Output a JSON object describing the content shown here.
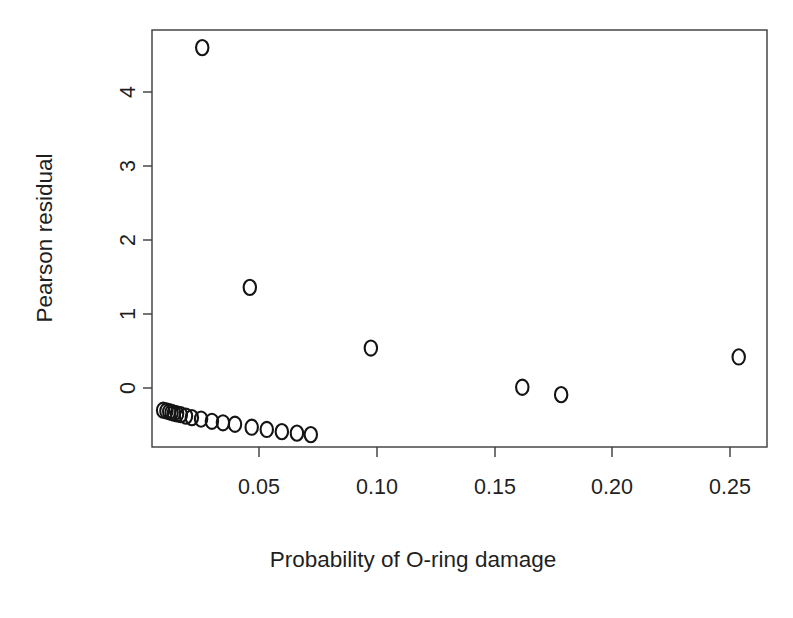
{
  "figure": {
    "kind": "scatter-plot",
    "background_color": "#ffffff",
    "foreground_color": "#1a1a1a",
    "point_symbol": "o",
    "point_color": "#141414"
  },
  "chart_data": {
    "type": "scatter",
    "title": "",
    "xlabel": "Probability of O-ring damage",
    "ylabel": "Pearson residual",
    "xlim": [
      0.0055,
      0.265
    ],
    "ylim": [
      -0.79,
      4.83
    ],
    "grid": false,
    "legend": null,
    "xticks": [
      0.05,
      0.1,
      0.15,
      0.2,
      0.25
    ],
    "xtick_labels": [
      "0.05",
      "0.10",
      "0.15",
      "0.20",
      "0.25"
    ],
    "yticks": [
      0,
      1,
      2,
      3,
      4
    ],
    "ytick_labels": [
      "0",
      "1",
      "2",
      "3",
      "4"
    ],
    "x": [
      0.0259,
      0.0461,
      0.0975,
      0.1618,
      0.1783,
      0.2537,
      0.0093,
      0.0107,
      0.0119,
      0.0129,
      0.0139,
      0.0152,
      0.0168,
      0.019,
      0.0215,
      0.0254,
      0.03,
      0.0347,
      0.0398,
      0.0469,
      0.0533,
      0.0597,
      0.0661,
      0.072
    ],
    "y": [
      4.6,
      1.36,
      0.54,
      0.01,
      -0.09,
      0.42,
      -0.3,
      -0.31,
      -0.32,
      -0.33,
      -0.34,
      -0.35,
      -0.36,
      -0.38,
      -0.4,
      -0.42,
      -0.45,
      -0.47,
      -0.49,
      -0.53,
      -0.56,
      -0.59,
      -0.61,
      -0.63
    ],
    "n_points": 24
  },
  "annotations": {
    "y_axis_label": "Pearson residual",
    "x_axis_label": "Probability of O-ring damage"
  }
}
